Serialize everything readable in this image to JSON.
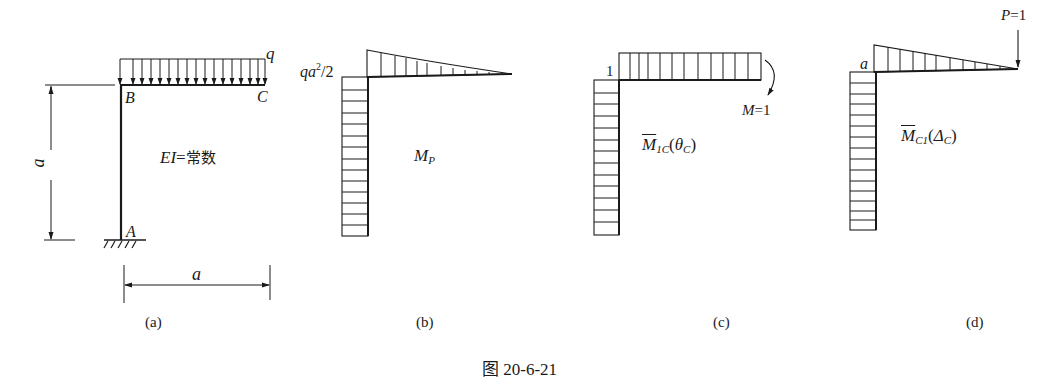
{
  "figure": {
    "caption": "图 20-6-21",
    "panels": [
      {
        "id": "a",
        "tag": "(a)",
        "description": "Rigid frame with fixed support at A, uniform load q on beam BC",
        "labels": {
          "load": "q",
          "node_B": "B",
          "node_C": "C",
          "node_A": "A",
          "height_dim": "a",
          "span_dim": "a",
          "stiffness_prefix": "EI",
          "stiffness_eq": "=",
          "stiffness_value": "常数"
        }
      },
      {
        "id": "b",
        "tag": "(b)",
        "description": "Bending moment diagram M_P",
        "labels": {
          "corner_value_q": "q",
          "corner_value_a": "a",
          "corner_value_exp": "2",
          "corner_value_rest": "/2",
          "diagram_name": "M",
          "diagram_sub": "P"
        }
      },
      {
        "id": "c",
        "tag": "(c)",
        "description": "Unit moment diagram for rotation at C",
        "labels": {
          "corner_value": "1",
          "unit_load_M": "M",
          "unit_load_eq": "=1",
          "diagram_name": "M",
          "diagram_sub": "1C",
          "diagram_arg_open": "(",
          "diagram_arg": "θ",
          "diagram_arg_sub": "C",
          "diagram_arg_close": ")"
        }
      },
      {
        "id": "d",
        "tag": "(d)",
        "description": "Unit moment diagram for deflection at C",
        "labels": {
          "corner_value": "a",
          "unit_load_P": "P",
          "unit_load_eq": "=1",
          "diagram_name": "M",
          "diagram_sub": "C1",
          "diagram_arg_open": "(",
          "diagram_arg": "Δ",
          "diagram_arg_sub": "C",
          "diagram_arg_close": ")"
        }
      }
    ]
  },
  "colors": {
    "ink": "#1a1a1a",
    "background": "#ffffff"
  }
}
